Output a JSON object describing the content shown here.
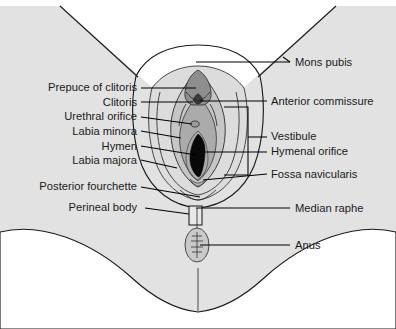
{
  "figure": {
    "type": "anatomical-illustration",
    "view": "lithotomy / frontal perineal view",
    "width": 396,
    "height": 329
  },
  "colors": {
    "background": "#ffffff",
    "body_fill": "#e2e2e2",
    "mons_fill": "#e2e2e2",
    "labia_majora_fill": "#e0e0e0",
    "labia_minora_fill": "#cfcfcf",
    "vestibule_fill": "#b9b9b9",
    "hymenal_orifice_fill": "#0a0a0a",
    "clitoris_fill": "#8c8c8c",
    "anus_fill": "#c9c9c9",
    "outline": "#1b1b1b",
    "leader_line": "#000000",
    "label_text": "#1a1a1a"
  },
  "labels_left": [
    {
      "id": "prepuce-of-clitoris",
      "text": "Prepuce of clitoris",
      "text_x": 137,
      "text_y": 91,
      "line_y": 88,
      "line_x1": 141,
      "line_x2": 196
    },
    {
      "id": "clitoris",
      "text": "Clitoris",
      "text_x": 137,
      "text_y": 106,
      "line_y": 102,
      "line_x1": 141,
      "line_x2": 193
    },
    {
      "id": "urethral-orifice",
      "text": "Urethral orifice",
      "text_x": 137,
      "text_y": 120,
      "line_y": 117,
      "line_x1": 141,
      "line_x2": 192
    },
    {
      "id": "labia-minora",
      "text": "Labia minora",
      "text_x": 137,
      "text_y": 135,
      "line_y": 131,
      "line_x1": 141,
      "line_x2": 181
    },
    {
      "id": "hymen",
      "text": "Hymen",
      "text_x": 137,
      "text_y": 150,
      "line_y": 146,
      "line_x1": 141,
      "line_x2": 196
    },
    {
      "id": "labia-majora",
      "text": "Labia majora",
      "text_x": 137,
      "text_y": 164,
      "line_y": 160,
      "line_x1": 141,
      "line_x2": 177
    },
    {
      "id": "posterior-fourchette",
      "text": "Posterior fourchette",
      "text_x": 137,
      "text_y": 190,
      "line_y": 187,
      "line_x1": 141,
      "line_x2": 200
    },
    {
      "id": "perineal-body",
      "text": "Perineal body",
      "text_x": 137,
      "text_y": 211,
      "line_y": 208,
      "line_x1": 145,
      "line_x2": 189
    }
  ],
  "labels_right": [
    {
      "id": "mons-pubis",
      "text": "Mons pubis",
      "text_x": 295,
      "text_y": 66,
      "line_y": 62,
      "line_x1": 196,
      "line_x2": 290
    },
    {
      "id": "anterior-commissure",
      "text": "Anterior commissure",
      "text_x": 271,
      "text_y": 105,
      "line_y": 101,
      "line_x1": 200,
      "line_x2": 267
    },
    {
      "id": "vestibule",
      "text": "Vestibule",
      "text_x": 271,
      "text_y": 140,
      "line_y": 137,
      "line_x1": 248,
      "line_x2": 267
    },
    {
      "id": "hymenal-orifice",
      "text": "Hymenal orifice",
      "text_x": 271,
      "text_y": 155,
      "line_y": 152,
      "line_x1": 204,
      "line_x2": 267
    },
    {
      "id": "fossa-navicularis",
      "text": "Fossa navicularis",
      "text_x": 271,
      "text_y": 178,
      "line_y": 174,
      "line_x1": 203,
      "line_x2": 267
    },
    {
      "id": "median-raphe",
      "text": "Median raphe",
      "text_x": 295,
      "text_y": 212,
      "line_y": 208,
      "line_x1": 196,
      "line_x2": 290
    },
    {
      "id": "anus",
      "text": "Anus",
      "text_x": 295,
      "text_y": 249,
      "line_y": 245,
      "line_x1": 200,
      "line_x2": 290
    }
  ],
  "structures": [
    {
      "id": "mons-pubis",
      "name": "Mons pubis"
    },
    {
      "id": "anterior-commissure",
      "name": "Anterior commissure"
    },
    {
      "id": "prepuce-of-clitoris",
      "name": "Prepuce of clitoris"
    },
    {
      "id": "clitoris",
      "name": "Clitoris"
    },
    {
      "id": "urethral-orifice",
      "name": "Urethral orifice"
    },
    {
      "id": "labia-minora",
      "name": "Labia minora"
    },
    {
      "id": "labia-majora",
      "name": "Labia majora"
    },
    {
      "id": "vestibule",
      "name": "Vestibule"
    },
    {
      "id": "hymen",
      "name": "Hymen"
    },
    {
      "id": "hymenal-orifice",
      "name": "Hymenal orifice"
    },
    {
      "id": "fossa-navicularis",
      "name": "Fossa navicularis"
    },
    {
      "id": "posterior-fourchette",
      "name": "Posterior fourchette"
    },
    {
      "id": "perineal-body",
      "name": "Perineal body"
    },
    {
      "id": "median-raphe",
      "name": "Median raphe"
    },
    {
      "id": "anus",
      "name": "Anus"
    }
  ]
}
